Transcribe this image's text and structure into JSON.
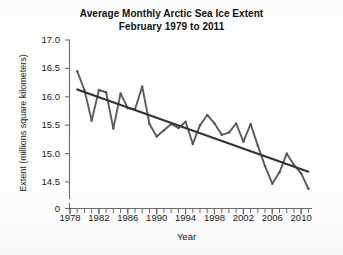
{
  "chart_data": {
    "type": "line",
    "title": "Average Monthly Arctic Sea Ice Extent",
    "subtitle": "February 1979 to 2011",
    "xlabel": "Year",
    "ylabel": "Extent (millions square kilometers)",
    "grid": false,
    "legend": "none",
    "xlim": [
      1978,
      2011.5
    ],
    "ylim": [
      14.2,
      17.0
    ],
    "y_axis_break": true,
    "y_break_label": "0",
    "xticks": [
      1978,
      1982,
      1986,
      1990,
      1994,
      1998,
      2002,
      2006,
      2010
    ],
    "xtick_labels": [
      "1978",
      "1982",
      "1986",
      "1990",
      "1994",
      "1998",
      "2002",
      "2006",
      "2010"
    ],
    "x_minor_tick_step": 1,
    "yticks": [
      14.5,
      15.0,
      15.5,
      16.0,
      16.5,
      17.0
    ],
    "ytick_labels": [
      "14.5",
      "15.0",
      "15.5",
      "16.0",
      "16.5",
      "17.0"
    ],
    "x": [
      1979,
      1980,
      1981,
      1982,
      1983,
      1984,
      1985,
      1986,
      1987,
      1988,
      1989,
      1990,
      1991,
      1992,
      1993,
      1994,
      1995,
      1996,
      1997,
      1998,
      1999,
      2000,
      2001,
      2002,
      2003,
      2004,
      2005,
      2006,
      2007,
      2008,
      2009,
      2010,
      2011
    ],
    "series": [
      {
        "name": "February Arctic sea ice extent",
        "color": "#4d4d4d",
        "marker": "dot",
        "values": [
          16.45,
          16.12,
          15.58,
          16.12,
          16.08,
          15.44,
          16.06,
          15.8,
          15.78,
          16.18,
          15.52,
          15.3,
          15.41,
          15.52,
          15.45,
          15.56,
          15.17,
          15.5,
          15.68,
          15.53,
          15.33,
          15.37,
          15.53,
          15.21,
          15.52,
          15.14,
          14.78,
          14.47,
          14.67,
          15.0,
          14.8,
          14.65,
          14.38
        ]
      }
    ],
    "trend_line": {
      "name": "Linear trend",
      "color": "#333333",
      "start": {
        "x": 1979.0,
        "y": 16.13
      },
      "end": {
        "x": 2011.0,
        "y": 14.68
      }
    }
  },
  "axes": {
    "y_break_tick": "0"
  }
}
